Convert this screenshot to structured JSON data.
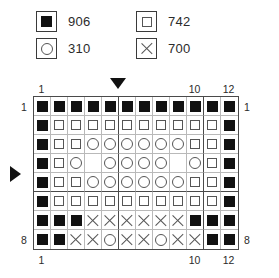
{
  "legend": {
    "rows": [
      [
        {
          "symbol": "filled-square",
          "code": "906"
        },
        {
          "symbol": "open-square",
          "code": "742"
        }
      ],
      [
        {
          "symbol": "circle",
          "code": "310"
        },
        {
          "symbol": "cross",
          "code": "700"
        }
      ]
    ]
  },
  "chart_data": {
    "type": "heatmap",
    "title": "",
    "columns": 12,
    "rows": 8,
    "symbol_codes": {
      "filled-square": "906",
      "open-square": "742",
      "circle": "310",
      "cross": "700",
      "blank": ""
    },
    "column_labels_top": [
      "1",
      "10",
      "12"
    ],
    "column_label_positions_top": [
      1,
      10,
      12
    ],
    "column_labels_bottom": [
      "1",
      "10",
      "12"
    ],
    "column_label_positions_bottom": [
      1,
      10,
      12
    ],
    "row_labels_left": [
      "1",
      "8"
    ],
    "row_label_positions_left": [
      1,
      8
    ],
    "row_labels_right": [
      "1",
      "8"
    ],
    "row_label_positions_right": [
      1,
      8
    ],
    "heavy_column_dividers_after": [
      5,
      10
    ],
    "heavy_row_dividers_after": [
      5
    ],
    "markers": [
      {
        "name": "top-column-marker",
        "direction": "down",
        "after_column": 5
      },
      {
        "name": "left-row-marker",
        "direction": "right",
        "after_row": 4
      }
    ],
    "grid": [
      [
        "filled-square",
        "filled-square",
        "filled-square",
        "filled-square",
        "filled-square",
        "filled-square",
        "filled-square",
        "filled-square",
        "filled-square",
        "filled-square",
        "filled-square",
        "filled-square"
      ],
      [
        "filled-square",
        "open-square",
        "open-square",
        "open-square",
        "open-square",
        "open-square",
        "open-square",
        "open-square",
        "open-square",
        "open-square",
        "open-square",
        "filled-square"
      ],
      [
        "filled-square",
        "open-square",
        "open-square",
        "circle",
        "circle",
        "circle",
        "circle",
        "circle",
        "circle",
        "open-square",
        "open-square",
        "filled-square"
      ],
      [
        "filled-square",
        "open-square",
        "circle",
        "blank",
        "circle",
        "circle",
        "circle",
        "circle",
        "blank",
        "circle",
        "open-square",
        "filled-square"
      ],
      [
        "filled-square",
        "open-square",
        "open-square",
        "circle",
        "circle",
        "circle",
        "circle",
        "circle",
        "circle",
        "open-square",
        "open-square",
        "filled-square"
      ],
      [
        "filled-square",
        "open-square",
        "open-square",
        "open-square",
        "open-square",
        "open-square",
        "open-square",
        "open-square",
        "open-square",
        "open-square",
        "open-square",
        "filled-square"
      ],
      [
        "filled-square",
        "filled-square",
        "filled-square",
        "cross",
        "cross",
        "cross",
        "cross",
        "cross",
        "cross",
        "filled-square",
        "filled-square",
        "filled-square"
      ],
      [
        "filled-square",
        "filled-square",
        "cross",
        "cross",
        "circle",
        "cross",
        "cross",
        "circle",
        "cross",
        "cross",
        "filled-square",
        "filled-square"
      ]
    ]
  }
}
